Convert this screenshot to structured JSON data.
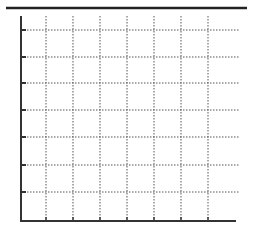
{
  "chart_data": {
    "type": "line",
    "title": "",
    "xlabel": "",
    "ylabel": "",
    "x_ticks": [
      "",
      "",
      "",
      "",
      "",
      "",
      ""
    ],
    "y_ticks": [
      "",
      "",
      "",
      "",
      "",
      "",
      ""
    ],
    "series": [],
    "grid": true,
    "grid_style": "dotted",
    "legend": "none",
    "xlim": [
      0,
      8
    ],
    "ylim": [
      0,
      8
    ]
  },
  "layout": {
    "top_rule": {
      "x1": 6,
      "x2": 247,
      "y": 8
    },
    "plot": {
      "left": 21,
      "bottom": 221,
      "right": 236,
      "top": 16
    },
    "x_grid_px": [
      46,
      73,
      100,
      127,
      154,
      181,
      208
    ],
    "y_grid_px": [
      30,
      57,
      83,
      110,
      137,
      165,
      192
    ],
    "grid_right": 239,
    "colors": {
      "axis": "#333333",
      "grid": "#555555",
      "rule": "#222222"
    }
  }
}
